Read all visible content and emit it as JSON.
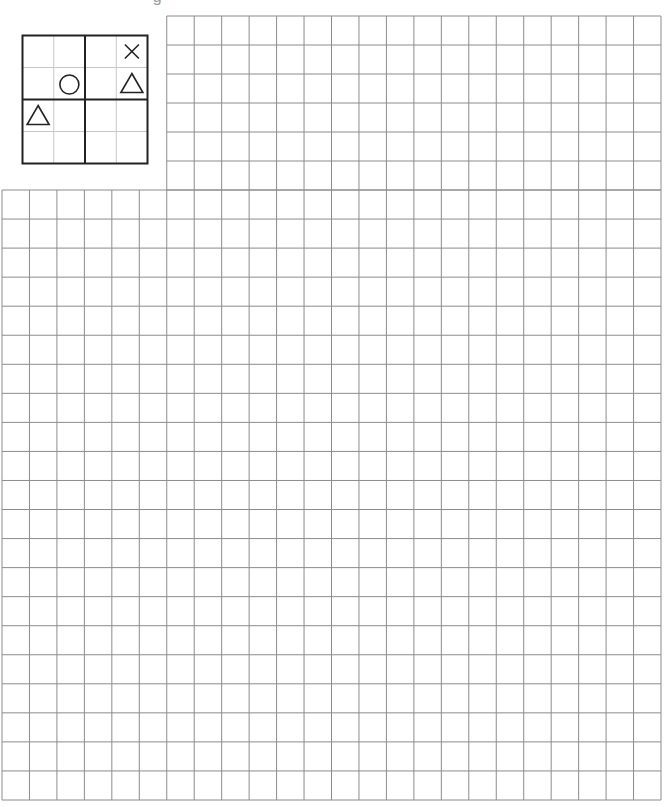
{
  "header": {
    "text": "— — —  — — —  g — — —"
  },
  "example_puzzle": {
    "rows": 4,
    "cols": 4,
    "block_rows": 2,
    "block_cols": 2,
    "symbols": [
      {
        "row": 0,
        "col": 3,
        "shape": "x-icon"
      },
      {
        "row": 1,
        "col": 1,
        "shape": "circle-icon"
      },
      {
        "row": 1,
        "col": 3,
        "shape": "triangle-icon"
      },
      {
        "row": 2,
        "col": 0,
        "shape": "triangle-icon"
      }
    ]
  },
  "answer_grid": {
    "upper_region": {
      "cols": 18,
      "rows": 6
    },
    "lower_region": {
      "cols": 24,
      "rows": 21
    },
    "line_color": "#8c8c8c"
  },
  "colors": {
    "thick_line": "#222222",
    "thin_line": "#c8c8c8",
    "grid_line": "#8c8c8c",
    "symbol": "#222222"
  }
}
